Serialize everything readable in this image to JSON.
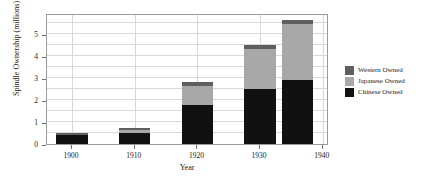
{
  "chart_data": {
    "type": "bar",
    "stacked": true,
    "title": "",
    "xlabel": "Year",
    "ylabel": "Spindle Ownership (millions)",
    "x": [
      1900,
      1910,
      1920,
      1930,
      1936
    ],
    "bar_width_years": 5,
    "categories": [
      "1900",
      "1910",
      "1920",
      "1930",
      "1936"
    ],
    "series": [
      {
        "name": "Chinese Owned",
        "color": "#111111",
        "values": [
          0.4,
          0.52,
          1.75,
          2.5,
          2.92
        ]
      },
      {
        "name": "Japanese Owned",
        "color": "#a8a8a8",
        "values": [
          0.02,
          0.1,
          0.87,
          1.83,
          2.55
        ]
      },
      {
        "name": "Western Owned",
        "color": "#5e5e5e",
        "values": [
          0.1,
          0.12,
          0.2,
          0.17,
          0.15
        ]
      }
    ],
    "totals": [
      0.52,
      0.74,
      2.82,
      4.5,
      5.62
    ],
    "xlim": [
      1896,
      1941
    ],
    "ylim": [
      0,
      5.95
    ],
    "xticks": [
      1900,
      1910,
      1920,
      1930,
      1940
    ],
    "xtick_labels": [
      "1900",
      "1910",
      "1920",
      "1930",
      "1940"
    ],
    "yticks": [
      0,
      1,
      2,
      3,
      4,
      5
    ],
    "ytick_labels": [
      "0",
      "1",
      "2",
      "3",
      "4",
      "5"
    ],
    "minor_ygrid": [
      0.5,
      1.5,
      2.5,
      3.5,
      4.5,
      5.5
    ],
    "grid": true,
    "legend_position": "right",
    "legend_entries": [
      {
        "label": "Western Owned",
        "color": "#5e5e5e"
      },
      {
        "label": "Japanese Owned",
        "color": "#a8a8a8"
      },
      {
        "label": "Chinese Owned",
        "color": "#111111"
      }
    ],
    "axis_color": "#9a9a9a",
    "grid_color": "#d9d9d9",
    "background": "#ffffff"
  }
}
